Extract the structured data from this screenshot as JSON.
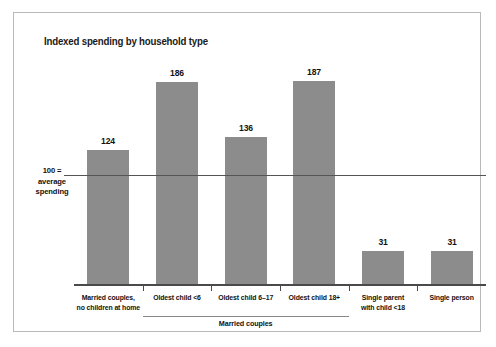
{
  "chart_data": {
    "type": "bar",
    "title": "Indexed spending by household type",
    "xlabel": "",
    "ylabel": "",
    "ylim": [
      0,
      200
    ],
    "grid": false,
    "legend": "none",
    "reference_line": {
      "value": 100,
      "label_lines": [
        "100 =",
        "average",
        "spending"
      ]
    },
    "categories": [
      "Married couples, no children at home",
      "Oldest child <6",
      "Oldest child 6–17",
      "Oldest child 18+",
      "Single parent with child <18",
      "Single person"
    ],
    "category_label_lines": [
      [
        "Married couples,",
        "no children at home"
      ],
      [
        "Oldest child <6"
      ],
      [
        "Oldest child 6–17"
      ],
      [
        "Oldest child 18+"
      ],
      [
        "Single parent",
        "with child <18"
      ],
      [
        "Single person"
      ]
    ],
    "values": [
      124,
      186,
      136,
      187,
      31,
      31
    ],
    "value_labels": [
      "124",
      "186",
      "136",
      "187",
      "31",
      "31"
    ],
    "group_bracket": {
      "label": "Married couples",
      "covers": [
        1,
        2,
        3
      ]
    },
    "colors": {
      "bar": "#8c8c8c",
      "axis": "#4a4a4a",
      "reference_line": "#555555",
      "text": "#111111",
      "frame": "#b9b9b9",
      "background": "#ffffff"
    }
  }
}
